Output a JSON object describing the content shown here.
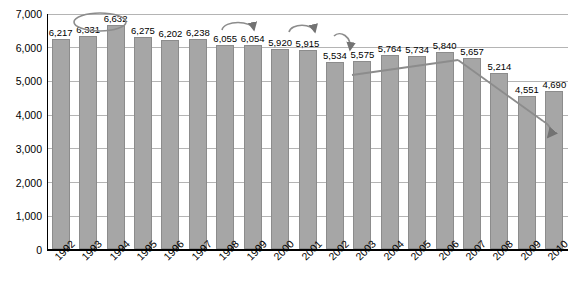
{
  "chart_data": {
    "type": "bar",
    "title": "",
    "xlabel": "",
    "ylabel": "",
    "ylim": [
      0,
      7000
    ],
    "grid": true,
    "legend": "none",
    "yticks": [
      "0",
      "1,000",
      "2,000",
      "3,000",
      "4,000",
      "5,000",
      "6,000",
      "7,000"
    ],
    "ytick_values": [
      0,
      1000,
      2000,
      3000,
      4000,
      5000,
      6000,
      7000
    ],
    "categories": [
      "1992",
      "1993",
      "1994",
      "1995",
      "1996",
      "1997",
      "1998",
      "1999",
      "2000",
      "2001",
      "2002",
      "2003",
      "2004",
      "2005",
      "2006",
      "2007",
      "2008",
      "2009",
      "2010"
    ],
    "values": [
      6217,
      6331,
      6632,
      6275,
      6202,
      6238,
      6055,
      6054,
      5920,
      5915,
      5534,
      5575,
      5764,
      5734,
      5840,
      5657,
      5214,
      4551,
      4690
    ],
    "data_labels": [
      "6,217",
      "6,331",
      "6,632",
      "6,275",
      "6,202",
      "6,238",
      "6,055",
      "6,054",
      "5,920",
      "5,915",
      "5,534",
      "5,575",
      "5,764",
      "5,734",
      "5,840",
      "5,657",
      "5,214",
      "4,551",
      "4,690"
    ],
    "annotations": [
      {
        "name": "ellipse-1994-peak",
        "type": "ellipse"
      },
      {
        "name": "arrow-1998-1999",
        "type": "curved-arrow"
      },
      {
        "name": "arrow-2000-2001",
        "type": "curved-arrow"
      },
      {
        "name": "arrow-2001-down",
        "type": "curved-arrow"
      },
      {
        "name": "trend-line-2002-2006-up",
        "type": "line"
      },
      {
        "name": "trend-line-2006-2010-down",
        "type": "arrow-line"
      }
    ],
    "colors": {
      "bar_fill": "#a6a6a6",
      "bar_stroke": "#8c8c8c",
      "grid": "#b4b4b4",
      "axis": "#000000",
      "text": "#000000",
      "annotation": "#737373"
    }
  }
}
